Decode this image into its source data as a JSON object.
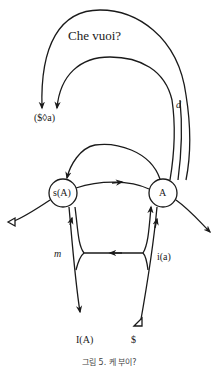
{
  "diagram": {
    "title": "Che vuoi?",
    "labels": {
      "fantasy": "($◊a)",
      "desire": "d",
      "signified_of_other": "s(A)",
      "other": "A",
      "ego": "m",
      "image": "i(a)",
      "ego_ideal": "I(A)",
      "barred_subject": "$"
    },
    "caption": "그림 5. 케 부이?",
    "colors": {
      "stroke": "#1a1a1a",
      "background": "#ffffff"
    }
  }
}
